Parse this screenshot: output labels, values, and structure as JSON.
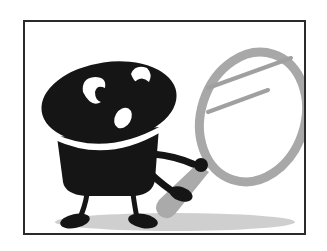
{
  "illustration": {
    "subject": "cartoon character holding magnifying glass",
    "alt": "Black cartoon creature peering through a large magnifying glass",
    "colors": {
      "frame": "#2a2a2a",
      "background": "#ffffff",
      "character": "#151515",
      "highlight": "#ffffff",
      "magnifier": "#a8a8a8",
      "shadow": "#c9c9c9"
    },
    "frame": {
      "x": 23,
      "y": 20,
      "width": 283,
      "height": 215
    }
  }
}
